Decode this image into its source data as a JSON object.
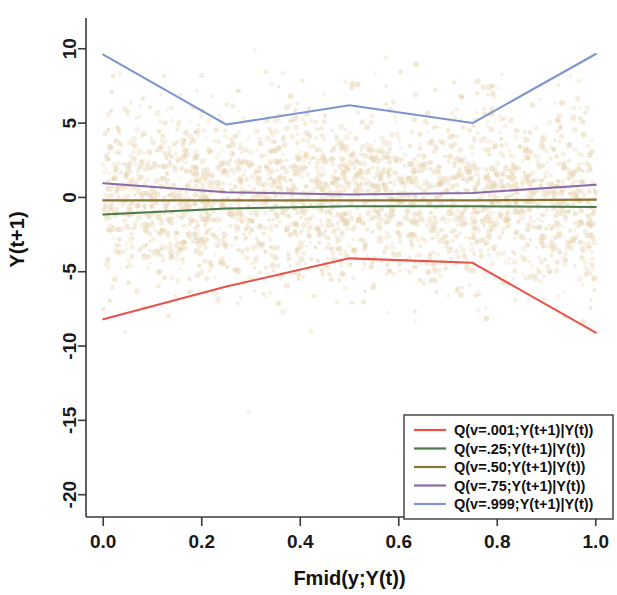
{
  "chart_data": {
    "type": "line",
    "title": "",
    "xlabel": "Fmid(y;Y(t))",
    "ylabel": "Y(t+1)",
    "xlim": [
      -0.035,
      1.035
    ],
    "ylim": [
      -21.5,
      11.8
    ],
    "xticks": [
      0.0,
      0.2,
      0.4,
      0.6,
      0.8,
      1.0
    ],
    "xtick_labels": [
      "0.0",
      "0.2",
      "0.4",
      "0.6",
      "0.8",
      "1.0"
    ],
    "yticks": [
      -20,
      -15,
      -10,
      -5,
      0,
      5,
      10
    ],
    "ytick_labels": [
      "-20",
      "-15",
      "-10",
      "-5",
      "0",
      "5",
      "10"
    ],
    "grid": false,
    "legend_position": "bottom-right",
    "x": [
      0.0,
      0.25,
      0.5,
      0.75,
      1.0
    ],
    "series": [
      {
        "name": "Q(v=.001;Y(t+1)|Y(t))",
        "color": "#e8524a",
        "values": [
          -8.2,
          -6.0,
          -4.1,
          -4.4,
          -9.1
        ]
      },
      {
        "name": "Q(v=.25;Y(t+1)|Y(t))",
        "color": "#4a7a4a",
        "values": [
          -1.15,
          -0.75,
          -0.6,
          -0.6,
          -0.65
        ]
      },
      {
        "name": "Q(v=.50;Y(t+1)|Y(t))",
        "color": "#8a7534",
        "values": [
          -0.2,
          -0.2,
          -0.2,
          -0.2,
          -0.15
        ]
      },
      {
        "name": "Q(v=.75;Y(t+1)|Y(t))",
        "color": "#8a6ba8",
        "values": [
          0.95,
          0.35,
          0.2,
          0.3,
          0.85
        ]
      },
      {
        "name": "Q(v=.999;Y(t+1)|Y(t))",
        "color": "#7b96cc",
        "values": [
          9.6,
          4.9,
          6.2,
          5.0,
          9.65
        ]
      }
    ],
    "scatter": {
      "name": "observations",
      "color": "#e6d2ae",
      "y_center": 0.0,
      "y_spread": 3.0,
      "point_count": 2600
    }
  },
  "axes": {
    "x_title": "Fmid(y;Y(t))",
    "y_title": "Y(t+1)"
  },
  "legend": {
    "entries": [
      "Q(v=.001;Y(t+1)|Y(t))",
      "Q(v=.25;Y(t+1)|Y(t))",
      "Q(v=.50;Y(t+1)|Y(t))",
      "Q(v=.75;Y(t+1)|Y(t))",
      "Q(v=.999;Y(t+1)|Y(t))"
    ]
  }
}
